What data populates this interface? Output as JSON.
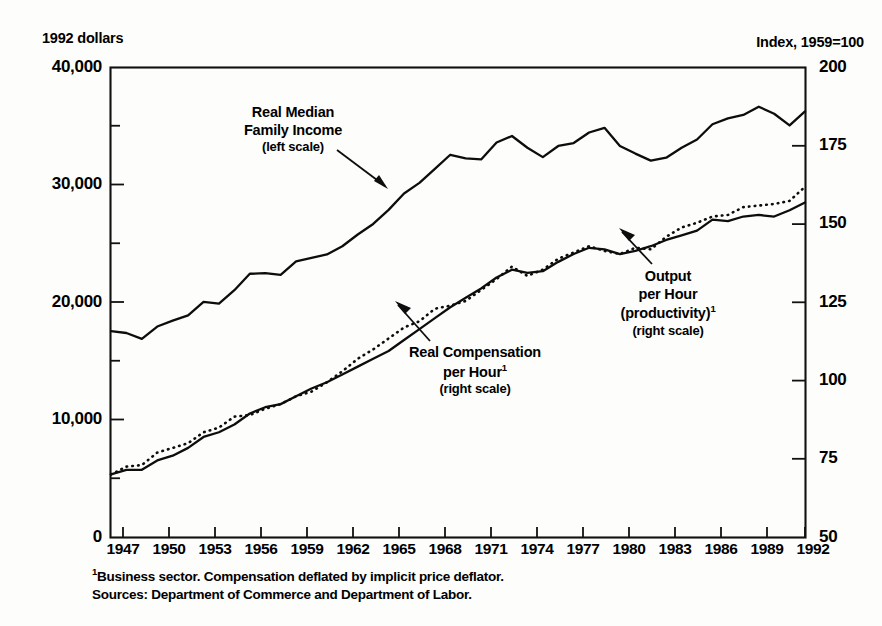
{
  "axis_titles": {
    "left": "1992 dollars",
    "right": "Index, 1959=100"
  },
  "annotations": {
    "income": {
      "line1": "Real Median",
      "line2": "Family Income",
      "line3": "(left scale)"
    },
    "compensation": {
      "line1": "Real Compensation",
      "line2": "per Hour",
      "sup": "1",
      "line3": "(right scale)"
    },
    "productivity": {
      "line1": "Output",
      "line2": "per Hour",
      "line3": "(productivity)",
      "sup": "1",
      "line4": "(right scale)"
    }
  },
  "footnotes": {
    "sup": "1",
    "note": "Business sector.  Compensation deflated by implicit price deflator.",
    "sources": "Sources:  Department of Commerce and Department of Labor."
  },
  "chart_data": {
    "type": "line",
    "title": "",
    "xlabel": "",
    "ylabel": "1992 dollars",
    "y2label": "Index, 1959=100",
    "grid": false,
    "legend": "inline-annotations",
    "xlim": [
      1947,
      1992
    ],
    "ylim": [
      0,
      40000
    ],
    "y2lim": [
      50,
      200
    ],
    "xticks": [
      1947,
      1950,
      1953,
      1956,
      1959,
      1962,
      1965,
      1968,
      1971,
      1974,
      1977,
      1980,
      1983,
      1986,
      1989,
      1992
    ],
    "yticks_left": [
      "0",
      "10,000",
      "20,000",
      "30,000",
      "40,000"
    ],
    "yticks_left_values": [
      0,
      10000,
      20000,
      30000,
      40000
    ],
    "yticks_left_minor": [
      5000,
      15000,
      25000,
      35000
    ],
    "yticks_right": [
      "50",
      "75",
      "100",
      "125",
      "150",
      "175",
      "200"
    ],
    "yticks_right_values": [
      50,
      75,
      100,
      125,
      150,
      175,
      200
    ],
    "x": [
      1947,
      1948,
      1949,
      1950,
      1951,
      1952,
      1953,
      1954,
      1955,
      1956,
      1957,
      1958,
      1959,
      1960,
      1961,
      1962,
      1963,
      1964,
      1965,
      1966,
      1967,
      1968,
      1969,
      1970,
      1971,
      1972,
      1973,
      1974,
      1975,
      1976,
      1977,
      1978,
      1979,
      1980,
      1981,
      1982,
      1983,
      1984,
      1985,
      1986,
      1987,
      1988,
      1989,
      1990,
      1991,
      1992
    ],
    "series": [
      {
        "name": "Real Median Family Income",
        "axis": "left",
        "style": "solid",
        "units": "1992 dollars",
        "values": [
          17550,
          17400,
          16900,
          17950,
          18450,
          18900,
          20050,
          19900,
          21050,
          22450,
          22500,
          22350,
          23500,
          23800,
          24100,
          24800,
          25800,
          26700,
          27900,
          29300,
          30200,
          31400,
          32600,
          32300,
          32200,
          33650,
          34200,
          33200,
          32400,
          33350,
          33600,
          34500,
          34900,
          33350,
          32700,
          32100,
          32350,
          33200,
          33900,
          35200,
          35700,
          36000,
          36700,
          36100,
          35100,
          36300
        ]
      },
      {
        "name": "Real Compensation per Hour",
        "axis": "right",
        "style": "solid",
        "units": "Index, 1959=100",
        "values": [
          70,
          71.5,
          71.5,
          74.5,
          76,
          78.5,
          82,
          83.5,
          86,
          89.5,
          91.5,
          92.5,
          95,
          97.5,
          99.5,
          102,
          104.5,
          107,
          109.5,
          113,
          116.5,
          120,
          123.5,
          126.5,
          129.5,
          133,
          135.5,
          134.5,
          135,
          138,
          140.5,
          142.5,
          142,
          140.5,
          141.5,
          143,
          145,
          146.5,
          148,
          151.5,
          151,
          152.5,
          153,
          152.5,
          154.5,
          157
        ]
      },
      {
        "name": "Output per Hour (productivity)",
        "axis": "right",
        "style": "dotted",
        "units": "Index, 1959=100",
        "values": [
          70,
          72.5,
          73,
          77,
          78.5,
          80,
          83.5,
          85,
          88.5,
          89,
          91,
          92.5,
          95,
          96.5,
          99.5,
          103,
          107,
          110,
          113.5,
          117,
          119,
          123,
          124,
          125.5,
          129,
          132.5,
          136.5,
          133.5,
          135.5,
          139,
          141,
          143,
          141.5,
          140.5,
          142.5,
          142,
          146,
          149,
          150.5,
          152.5,
          153,
          155.5,
          156,
          156.5,
          157.5,
          162
        ]
      }
    ],
    "notes": [
      "Productivity (dotted) tracks compensation (solid) closely through the mid-1970s, then diverges above it after about 1978."
    ]
  }
}
